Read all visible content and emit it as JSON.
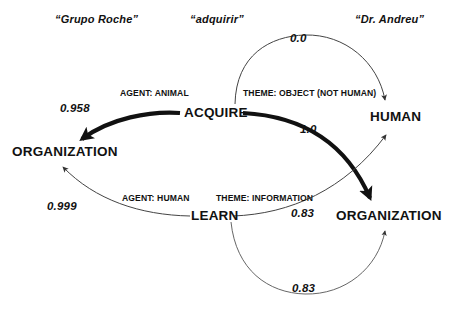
{
  "diagram": {
    "type": "semantic-role-graph",
    "background": "#ffffff",
    "ink": "#111111",
    "words": [
      {
        "id": "w1",
        "text": "“Grupo Roche”"
      },
      {
        "id": "w2",
        "text": "“adquirir”"
      },
      {
        "id": "w3",
        "text": "“Dr. Andreu”"
      }
    ],
    "nodes": [
      {
        "id": "acquire",
        "label": "ACQUIRE"
      },
      {
        "id": "org_left",
        "label": "ORGANIZATION"
      },
      {
        "id": "human",
        "label": "HUMAN"
      },
      {
        "id": "learn",
        "label": "LEARN"
      },
      {
        "id": "org_right",
        "label": "ORGANIZATION"
      }
    ],
    "edges": [
      {
        "id": "e1",
        "from": "acquire",
        "to": "org_left",
        "role": "AGENT: ANIMAL",
        "weight": "0.958",
        "style": "thick"
      },
      {
        "id": "e2",
        "from": "acquire",
        "to": "human",
        "role": "THEME: OBJECT (NOT HUMAN)",
        "weight": "0.0",
        "style": "thin"
      },
      {
        "id": "e3",
        "from": "acquire",
        "to": "org_right",
        "role": "",
        "weight": "1.0",
        "style": "thick"
      },
      {
        "id": "e4",
        "from": "learn",
        "to": "org_left",
        "role": "AGENT: HUMAN",
        "weight": "0.999",
        "style": "thin"
      },
      {
        "id": "e5",
        "from": "learn",
        "to": "human",
        "role": "THEME: INFORMATION",
        "weight": "0.83",
        "style": "thin"
      },
      {
        "id": "e6",
        "from": "learn",
        "to": "org_right",
        "role": "",
        "weight": "0.83",
        "style": "thin"
      }
    ],
    "weights": [
      {
        "id": "wt_958",
        "text": "0.958"
      },
      {
        "id": "wt_00",
        "text": "0.0"
      },
      {
        "id": "wt_10",
        "text": "1.0"
      },
      {
        "id": "wt_999",
        "text": "0.999"
      },
      {
        "id": "wt_083a",
        "text": "0.83"
      },
      {
        "id": "wt_083b",
        "text": "0.83"
      }
    ],
    "roles": [
      {
        "id": "r_agent_animal",
        "text": "AGENT: ANIMAL"
      },
      {
        "id": "r_theme_object",
        "text": "THEME: OBJECT (NOT HUMAN)"
      },
      {
        "id": "r_agent_human",
        "text": "AGENT: HUMAN"
      },
      {
        "id": "r_theme_info",
        "text": "THEME: INFORMATION"
      }
    ]
  }
}
